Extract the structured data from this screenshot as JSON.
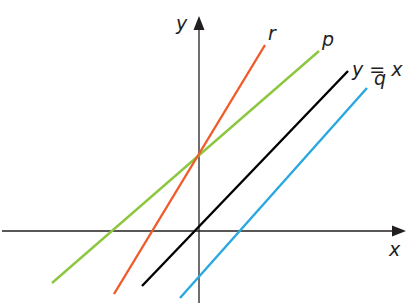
{
  "diagram": {
    "type": "coordinate-plane-lines",
    "axes": {
      "x_label": "x",
      "y_label": "y",
      "color": "#231f20",
      "origin_px": [
        199,
        231
      ]
    },
    "lines": [
      {
        "name": "p",
        "label": "p",
        "color": "#8dc63f",
        "x1": 52,
        "y1": 283,
        "x2": 319,
        "y2": 51,
        "label_pos": [
          322,
          46
        ]
      },
      {
        "name": "r",
        "label": "r",
        "color": "#f15a29",
        "x1": 114,
        "y1": 294,
        "x2": 265,
        "y2": 45,
        "label_pos": [
          268,
          40
        ]
      },
      {
        "name": "y=x",
        "label": "y = x",
        "color": "#000000",
        "x1": 142,
        "y1": 286,
        "x2": 348,
        "y2": 71,
        "label_pos": [
          352,
          76
        ]
      },
      {
        "name": "q",
        "label": "q",
        "color": "#29a8e0",
        "x1": 180,
        "y1": 298,
        "x2": 367,
        "y2": 88,
        "label_pos": [
          374,
          85
        ]
      }
    ]
  },
  "chart_data": {
    "type": "line",
    "title": "",
    "xlabel": "x",
    "ylabel": "y",
    "grid": false,
    "series": [
      {
        "name": "y = x",
        "slope": 1,
        "intercept": 0,
        "color": "#000000"
      },
      {
        "name": "p",
        "slope": "< 1 (shallower than y = x)",
        "intercept": "positive (shared with r)",
        "color": "#8dc63f"
      },
      {
        "name": "r",
        "slope": "> 1 (steeper than y = x)",
        "intercept": "positive (shared with p)",
        "color": "#f15a29"
      },
      {
        "name": "q",
        "slope": 1,
        "intercept": "negative (parallel to y = x)",
        "color": "#29a8e0"
      }
    ],
    "annotations": [
      "p and r intersect on the y-axis",
      "q is parallel to y = x"
    ]
  }
}
